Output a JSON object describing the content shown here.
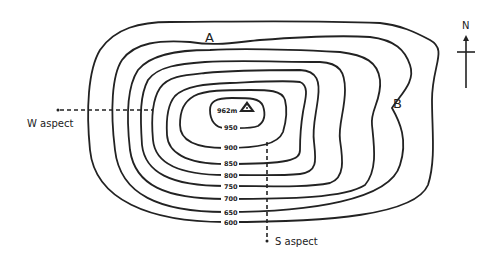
{
  "diagram": {
    "summit": {
      "label": "962m",
      "elevation": 962
    },
    "contours": [
      {
        "label": "950",
        "value": 950
      },
      {
        "label": "900",
        "value": 900
      },
      {
        "label": "850",
        "value": 850
      },
      {
        "label": "800",
        "value": 800
      },
      {
        "label": "750",
        "value": 750
      },
      {
        "label": "700",
        "value": 700
      },
      {
        "label": "650",
        "value": 650
      },
      {
        "label": "600",
        "value": 600
      }
    ],
    "points": {
      "a": "A",
      "b": "B"
    },
    "aspects": {
      "west": "W aspect",
      "south": "S aspect"
    },
    "north_arrow": {
      "label": "N"
    }
  }
}
